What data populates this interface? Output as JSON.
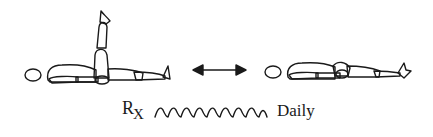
{
  "figure": {
    "pose_1": "supine-leg-raised",
    "pose_2": "supine-legs-flat",
    "transition_icon": "double-arrow-icon"
  },
  "prescription": {
    "symbol_r": "R",
    "symbol_x": "X",
    "frequency": "Daily",
    "wave_cycles": 9
  },
  "colors": {
    "line": "#1a1a1a",
    "background": "#ffffff"
  }
}
